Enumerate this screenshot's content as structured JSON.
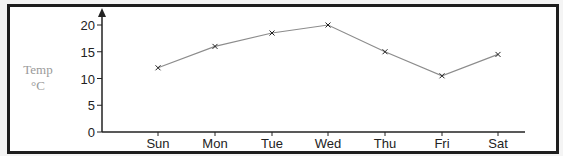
{
  "chart_data": {
    "type": "line",
    "title": "",
    "xlabel": "",
    "ylabel": [
      "Temp",
      "°C"
    ],
    "categories": [
      "Sun",
      "Mon",
      "Tue",
      "Wed",
      "Thu",
      "Fri",
      "Sat"
    ],
    "series": [
      {
        "name": "Temperature",
        "values": [
          12,
          16,
          18.5,
          20,
          15,
          10.5,
          14.5
        ]
      }
    ],
    "ylim": [
      0,
      20
    ],
    "yticks": [
      0,
      5,
      10,
      15,
      20
    ],
    "grid": false,
    "legend": null,
    "marker": "x",
    "colors": {
      "line": "#8c8c8c",
      "marker": "#222222",
      "axis": "#222222",
      "ylabel": "#9a9a9a",
      "frame": "#1e1e1e"
    }
  }
}
